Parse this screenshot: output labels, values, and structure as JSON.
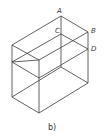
{
  "figure": {
    "caption": "b)",
    "point_labels": {
      "A": "A",
      "B": "B",
      "C": "C",
      "D": "D"
    },
    "line_color": "#3a3a3a"
  }
}
